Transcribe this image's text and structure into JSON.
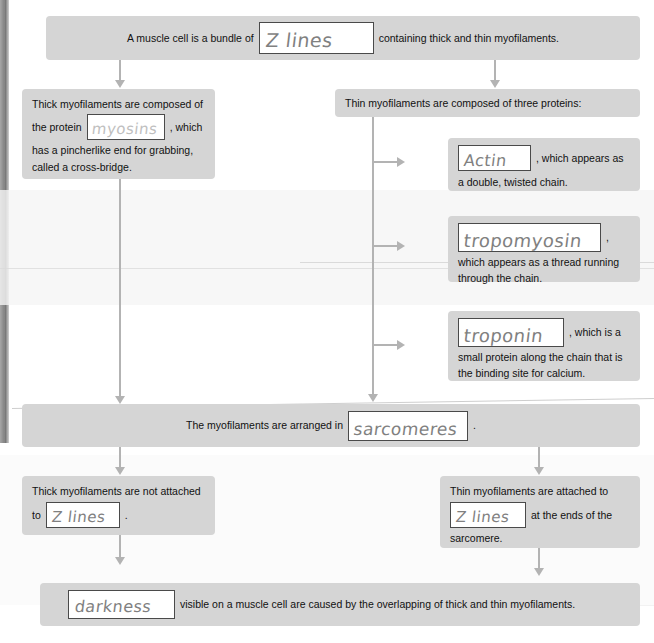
{
  "worksheet": {
    "title": "Muscle Cell Structure Fill-in-the-Blank Flowchart",
    "blank_field_placeholder": ""
  },
  "boxes": {
    "intro": {
      "text_before": "A muscle cell is a bundle of",
      "answer": "Z lines",
      "text_after": "containing thick and thin myofilaments."
    },
    "thick": {
      "line1": "Thick myofilaments are composed of",
      "line2_before": "the protein",
      "answer": "myosins",
      "line2_after": ", which",
      "line3": "has a pincherlike end for grabbing,",
      "line4": "called a cross-bridge."
    },
    "thin_header": {
      "text": "Thin myofilaments are composed of three proteins:"
    },
    "actin": {
      "answer": "Actin",
      "text_after": ", which appears as",
      "line2": "a double, twisted chain."
    },
    "tropomyosin": {
      "answer": "tropomyosin",
      "text_after": ",",
      "line2": "which appears as a thread running",
      "line3": "through the chain."
    },
    "troponin": {
      "answer": "troponin",
      "text_after": ", which is a",
      "line2": "small protein along the chain that is",
      "line3": "the binding site for calcium."
    },
    "sarcomeres": {
      "text_before": "The myofilaments are arranged in",
      "answer": "sarcomeres",
      "text_after": "."
    },
    "thick_not_attached": {
      "line1": "Thick myofilaments are not attached",
      "line2_before": "to",
      "answer": "Z lines",
      "line2_after": "."
    },
    "thin_attached": {
      "line1": "Thin myofilaments are attached to",
      "answer": "Z lines",
      "line2_after": "at the ends of the",
      "line3": "sarcomere."
    },
    "darkness": {
      "answer": "darkness",
      "text_after": "visible on a muscle cell are caused by the overlapping of thick and thin myofilaments."
    }
  },
  "colors": {
    "box_fill": "#d5d5d5",
    "connector": "#b3b3b3",
    "blank_border": "#4a4a4a",
    "handwriting": "#6a6a6a",
    "page": "#ffffff"
  }
}
